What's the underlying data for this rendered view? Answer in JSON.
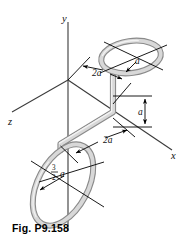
{
  "figure": {
    "caption": "Fig. P9.158",
    "axes": {
      "y_label": "y",
      "z_label": "z",
      "x_label": "x"
    },
    "dimensions": {
      "upper_offset": "2a",
      "upper_radius": "a",
      "vertical_drop": "a",
      "lower_offset": "2a",
      "lower_radius_numerator": "3",
      "lower_radius_denominator": "2",
      "lower_radius_symbol": "a"
    },
    "colors": {
      "background": "#ffffff",
      "tube_shade": "#8a8a8a",
      "tube_fill": "#d8d8d8",
      "tube_highlight": "#f2f2f2",
      "axis": "#3a3a3a",
      "annotation": "#000000"
    }
  }
}
